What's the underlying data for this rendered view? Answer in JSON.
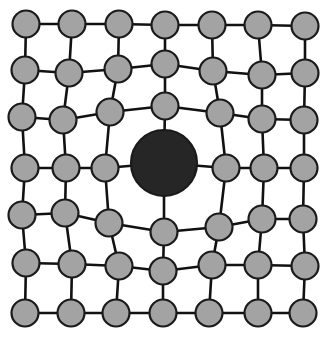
{
  "diagram": {
    "type": "lattice-graph",
    "width": 327,
    "height": 337,
    "colors": {
      "background": "#ffffff",
      "node_fill": "#a3a3a3",
      "node_stroke": "#1a1a1a",
      "center_fill": "#262626",
      "edge": "#111111"
    },
    "node_radius": 13.5,
    "center_radius": 33,
    "edge_width": 2.6,
    "rows": 7,
    "cols": 7,
    "center": {
      "row": 3,
      "col": 3,
      "x": 164,
      "y": 163
    },
    "grid": [
      [
        [
          26,
          24
        ],
        [
          72,
          24
        ],
        [
          119,
          24
        ],
        [
          165,
          25
        ],
        [
          212,
          25
        ],
        [
          258,
          25
        ],
        [
          305,
          26
        ]
      ],
      [
        [
          25,
          70
        ],
        [
          69,
          73
        ],
        [
          118,
          69
        ],
        [
          165,
          64
        ],
        [
          213,
          71
        ],
        [
          262,
          75
        ],
        [
          305,
          73
        ]
      ],
      [
        [
          22,
          117
        ],
        [
          63,
          120
        ],
        [
          110,
          112
        ],
        [
          165,
          106
        ],
        [
          220,
          113
        ],
        [
          262,
          119
        ],
        [
          304,
          120
        ]
      ],
      [
        [
          25,
          168
        ],
        [
          66,
          168
        ],
        [
          105,
          168
        ],
        [
          164,
          163
        ],
        [
          226,
          168
        ],
        [
          264,
          168
        ],
        [
          304,
          168
        ]
      ],
      [
        [
          22,
          215
        ],
        [
          65,
          213
        ],
        [
          109,
          223
        ],
        [
          164,
          232
        ],
        [
          219,
          227
        ],
        [
          262,
          219
        ],
        [
          303,
          219
        ]
      ],
      [
        [
          26,
          263
        ],
        [
          72,
          264
        ],
        [
          119,
          266
        ],
        [
          163,
          271
        ],
        [
          212,
          265
        ],
        [
          258,
          265
        ],
        [
          305,
          266
        ]
      ],
      [
        [
          25,
          313
        ],
        [
          71,
          313
        ],
        [
          116,
          313
        ],
        [
          163,
          313
        ],
        [
          209,
          313
        ],
        [
          258,
          313
        ],
        [
          303,
          313
        ]
      ]
    ]
  }
}
